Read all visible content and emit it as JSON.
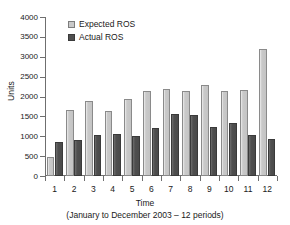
{
  "chart_data": {
    "type": "bar",
    "title": "",
    "xlabel": "Time",
    "xcaption": "(January to December 2003 – 12 periods)",
    "ylabel": "Units",
    "ylim": [
      0,
      4000
    ],
    "ytick_step": 500,
    "yticks": [
      "4000",
      "3500",
      "3000",
      "2500",
      "2000",
      "1500",
      "1000",
      "500",
      "0"
    ],
    "ytick_values": [
      4000,
      3500,
      3000,
      2500,
      2000,
      1500,
      1000,
      500,
      0
    ],
    "categories": [
      "1",
      "2",
      "3",
      "4",
      "5",
      "6",
      "7",
      "8",
      "9",
      "10",
      "11",
      "12"
    ],
    "grid": false,
    "legend_position": "top-left-inside",
    "series": [
      {
        "name": "Expected ROS",
        "color": "#c9c9c9",
        "values": [
          480,
          1660,
          1880,
          1635,
          1940,
          2150,
          2200,
          2130,
          2300,
          2130,
          2175,
          3200
        ]
      },
      {
        "name": "Actual ROS",
        "color": "#4f4f4f",
        "values": [
          860,
          900,
          1035,
          1050,
          1005,
          1205,
          1570,
          1545,
          1245,
          1340,
          1020,
          920
        ]
      }
    ]
  }
}
